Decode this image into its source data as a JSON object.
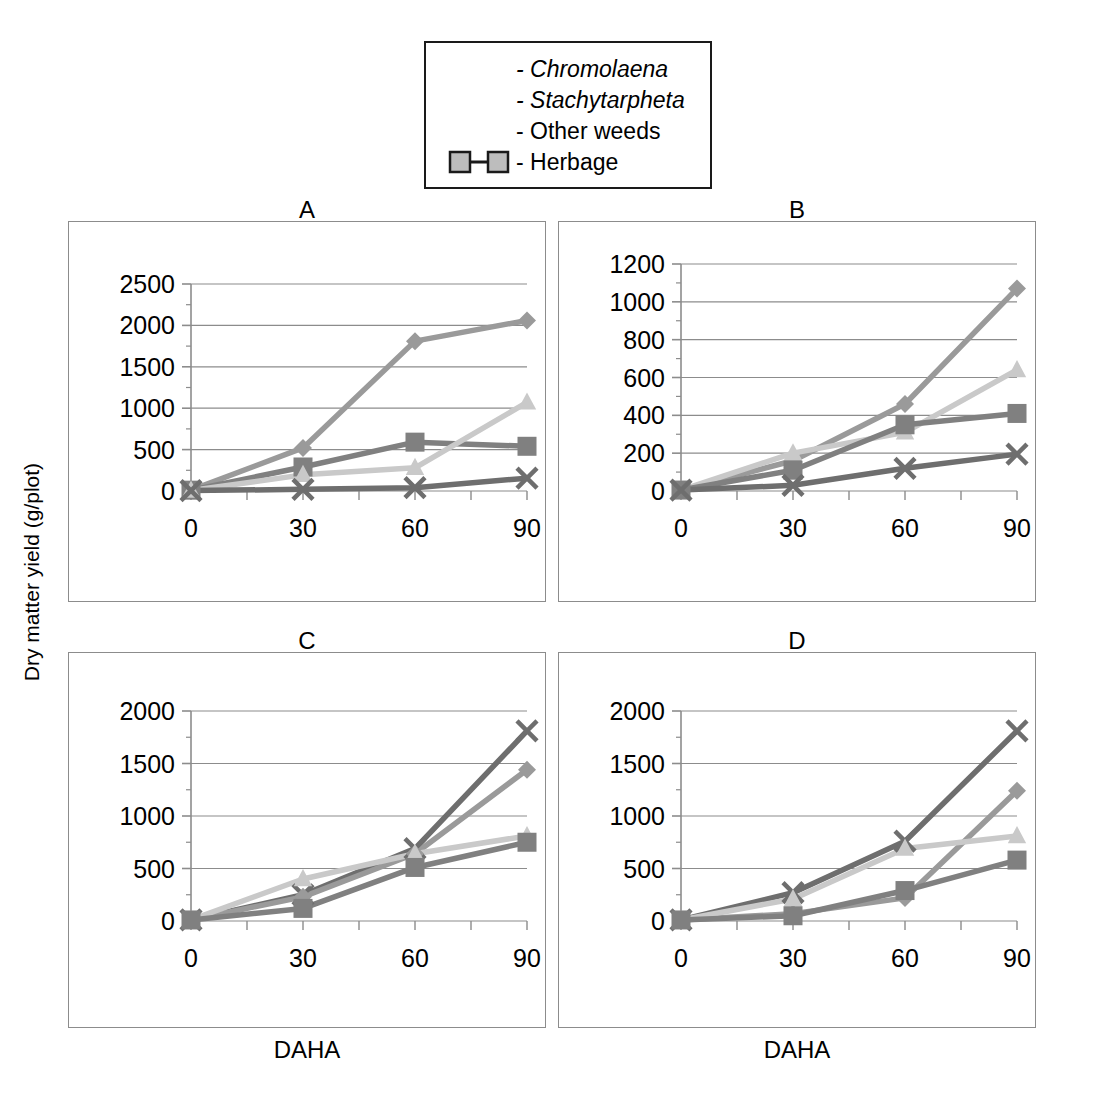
{
  "legend": {
    "entries": [
      {
        "label": "Chromolaena",
        "dash": "-",
        "italic": true,
        "marker": "diamond",
        "color": "#9a9a9a",
        "show_symbol": false
      },
      {
        "label": "Stachytarpheta",
        "dash": "-",
        "italic": true,
        "marker": "x",
        "color": "#6e6e6e",
        "show_symbol": false
      },
      {
        "label": "Other weeds",
        "dash": "-",
        "italic": false,
        "marker": "triangle",
        "color": "#c9c9c9",
        "show_symbol": false
      },
      {
        "label": "Herbage",
        "dash": "-",
        "italic": false,
        "marker": "square",
        "color": "#808080",
        "show_symbol": true
      }
    ]
  },
  "axis_titles": {
    "y": "Dry matter yield (g/plot)",
    "x": "DAHA"
  },
  "colors": {
    "chromolaena": "#9a9a9a",
    "stachytarpheta": "#6e6e6e",
    "other_weeds": "#c9c9c9",
    "herbage": "#808080",
    "gridline": "#8c8c8c",
    "frame": "#8c8c8c",
    "text": "#000000"
  },
  "chart_data": [
    {
      "type": "line",
      "title": "A",
      "xlabel": "DAHA",
      "ylabel": "Dry matter yield (g/plot)",
      "x": [
        0,
        30,
        60,
        90
      ],
      "xticklabels": [
        "0",
        "30",
        "60",
        "90"
      ],
      "ylim": [
        0,
        2500
      ],
      "yticks": [
        0,
        500,
        1000,
        1500,
        2000,
        2500
      ],
      "yticklabels": [
        "0",
        "500",
        "1000",
        "1500",
        "2000",
        "2500"
      ],
      "grid": true,
      "legend_position": "external-top",
      "series": [
        {
          "name": "Chromolaena",
          "marker": "diamond",
          "color": "#9a9a9a",
          "values": [
            10,
            520,
            1810,
            2060
          ]
        },
        {
          "name": "Herbage",
          "marker": "square",
          "color": "#808080",
          "values": [
            10,
            290,
            590,
            540
          ]
        },
        {
          "name": "Other weeds",
          "marker": "triangle",
          "color": "#c9c9c9",
          "values": [
            5,
            195,
            280,
            1070
          ]
        },
        {
          "name": "Stachytarpheta",
          "marker": "x",
          "color": "#6e6e6e",
          "values": [
            5,
            20,
            40,
            155
          ]
        }
      ]
    },
    {
      "type": "line",
      "title": "B",
      "xlabel": "DAHA",
      "ylabel": "Dry matter yield (g/plot)",
      "x": [
        0,
        30,
        60,
        90
      ],
      "xticklabels": [
        "0",
        "30",
        "60",
        "90"
      ],
      "ylim": [
        0,
        1200
      ],
      "yticks": [
        0,
        200,
        400,
        600,
        800,
        1000,
        1200
      ],
      "yticklabels": [
        "0",
        "200",
        "400",
        "600",
        "800",
        "1000",
        "1200"
      ],
      "grid": true,
      "legend_position": "external-top",
      "series": [
        {
          "name": "Chromolaena",
          "marker": "diamond",
          "color": "#9a9a9a",
          "values": [
            5,
            160,
            460,
            1070
          ]
        },
        {
          "name": "Other weeds",
          "marker": "triangle",
          "color": "#c9c9c9",
          "values": [
            5,
            200,
            310,
            640
          ]
        },
        {
          "name": "Herbage",
          "marker": "square",
          "color": "#808080",
          "values": [
            5,
            110,
            350,
            410
          ]
        },
        {
          "name": "Stachytarpheta",
          "marker": "x",
          "color": "#6e6e6e",
          "values": [
            5,
            30,
            120,
            195
          ]
        }
      ]
    },
    {
      "type": "line",
      "title": "C",
      "xlabel": "DAHA",
      "ylabel": "Dry matter yield (g/plot)",
      "x": [
        0,
        30,
        60,
        90
      ],
      "xticklabels": [
        "0",
        "30",
        "60",
        "90"
      ],
      "ylim": [
        0,
        2000
      ],
      "yticks": [
        0,
        500,
        1000,
        1500,
        2000
      ],
      "yticklabels": [
        "0",
        "500",
        "1000",
        "1500",
        "2000"
      ],
      "grid": true,
      "legend_position": "external-top",
      "series": [
        {
          "name": "Stachytarpheta",
          "marker": "x",
          "color": "#6e6e6e",
          "values": [
            10,
            250,
            690,
            1810
          ]
        },
        {
          "name": "Chromolaena",
          "marker": "diamond",
          "color": "#9a9a9a",
          "values": [
            10,
            230,
            640,
            1440
          ]
        },
        {
          "name": "Other weeds",
          "marker": "triangle",
          "color": "#c9c9c9",
          "values": [
            10,
            400,
            640,
            810
          ]
        },
        {
          "name": "Herbage",
          "marker": "square",
          "color": "#808080",
          "values": [
            10,
            120,
            510,
            750
          ]
        }
      ]
    },
    {
      "type": "line",
      "title": "D",
      "xlabel": "DAHA",
      "ylabel": "Dry matter yield (g/plot)",
      "x": [
        0,
        30,
        60,
        90
      ],
      "xticklabels": [
        "0",
        "30",
        "60",
        "90"
      ],
      "ylim": [
        0,
        2000
      ],
      "yticks": [
        0,
        500,
        1000,
        1500,
        2000
      ],
      "yticklabels": [
        "0",
        "500",
        "1000",
        "1500",
        "2000"
      ],
      "grid": true,
      "legend_position": "external-top",
      "series": [
        {
          "name": "Stachytarpheta",
          "marker": "x",
          "color": "#6e6e6e",
          "values": [
            10,
            270,
            760,
            1810
          ]
        },
        {
          "name": "Chromolaena",
          "marker": "diamond",
          "color": "#9a9a9a",
          "values": [
            10,
            70,
            220,
            1240
          ]
        },
        {
          "name": "Other weeds",
          "marker": "triangle",
          "color": "#c9c9c9",
          "values": [
            10,
            210,
            690,
            810
          ]
        },
        {
          "name": "Herbage",
          "marker": "square",
          "color": "#808080",
          "values": [
            10,
            50,
            290,
            580
          ]
        }
      ]
    }
  ]
}
